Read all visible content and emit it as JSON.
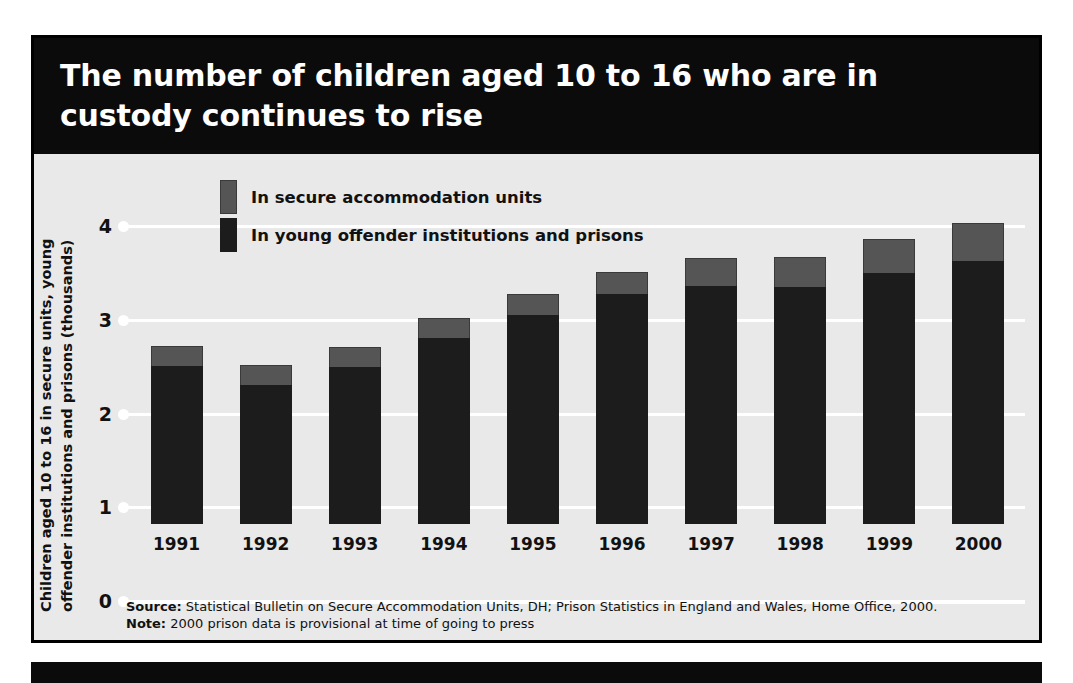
{
  "title": "The number of children aged 10 to 16 who are in custody continues to rise",
  "colors": {
    "banner_background": "#0b0b0b",
    "plot_background": "#e9e9e9",
    "gridline": "#ffffff",
    "secure_accommodation": "#555555",
    "young_offender_institutions": "#1c1c1c",
    "text": "#111111"
  },
  "legend": {
    "items": [
      {
        "label": "In secure accommodation units",
        "color": "#555555",
        "key": "secure"
      },
      {
        "label": "In young offender institutions and prisons",
        "color": "#1c1c1c",
        "key": "yoi"
      }
    ]
  },
  "footnotes": {
    "source_label": "Source:",
    "source_text": " Statistical Bulletin on Secure Accommodation Units, DH; Prison Statistics in England and Wales, Home Office, 2000.",
    "note_label": "Note:",
    "note_text": " 2000 prison data is provisional at time of going to press"
  },
  "chart_data": {
    "type": "bar",
    "stacked": true,
    "title": "The number of children aged 10 to 16 who are in custody continues to rise",
    "xlabel": "",
    "ylabel": "Children aged 10 to 16 in secure units, young\noffender institutions and prisons (thousands)",
    "ylim": [
      0,
      4
    ],
    "yticks": [
      0,
      1,
      2,
      3,
      4
    ],
    "ytick_labels": [
      "0",
      "1",
      "2",
      "3",
      "4"
    ],
    "grid": true,
    "legend_position": "top-left-inside",
    "categories": [
      "1991",
      "1992",
      "1993",
      "1994",
      "1995",
      "1996",
      "1997",
      "1998",
      "1999",
      "2000"
    ],
    "series": [
      {
        "name": "In young offender institutions and prisons",
        "color": "#1c1c1c",
        "values": [
          1.69,
          1.48,
          1.67,
          1.98,
          2.23,
          2.45,
          2.54,
          2.53,
          2.68,
          2.81
        ]
      },
      {
        "name": "In secure accommodation units",
        "color": "#555555",
        "values": [
          0.21,
          0.22,
          0.22,
          0.22,
          0.22,
          0.24,
          0.3,
          0.32,
          0.36,
          0.4
        ]
      }
    ],
    "totals": [
      1.9,
      1.7,
      1.89,
      2.2,
      2.45,
      2.69,
      2.84,
      2.85,
      3.04,
      3.21
    ]
  }
}
